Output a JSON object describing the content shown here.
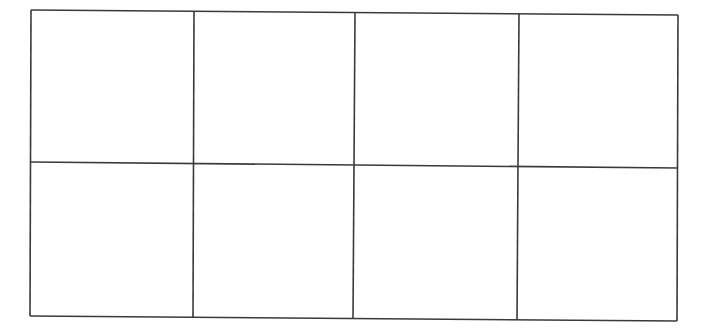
{
  "diagram": {
    "type": "grid",
    "rows": 2,
    "columns": 4,
    "cells": [
      [
        "",
        "",
        "",
        ""
      ],
      [
        "",
        "",
        "",
        ""
      ]
    ],
    "line_color": "#3a3a3a",
    "background_color": "#ffffff"
  }
}
